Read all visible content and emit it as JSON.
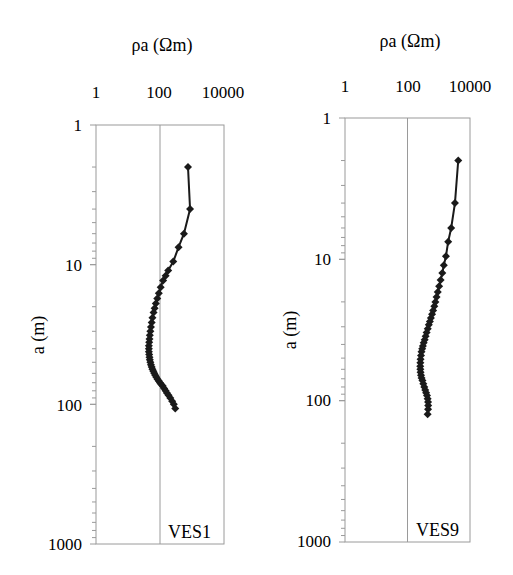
{
  "chart_data": [
    {
      "type": "scatter",
      "title": "",
      "xlabel": "ρa (Ωm)",
      "ylabel": "a (m)",
      "xscale": "log",
      "yscale": "log",
      "y_inverted": true,
      "x_axis_position": "top",
      "xlim": [
        1,
        10000
      ],
      "ylim": [
        1,
        1000
      ],
      "xticks": [
        "1",
        "100",
        "10000"
      ],
      "yticks": [
        "1",
        "10",
        "100",
        "1000"
      ],
      "grid": "vertical line at 100",
      "annotation": "VES1",
      "series": [
        {
          "name": "VES1",
          "marker": "diamond",
          "line": true,
          "x": [
            750,
            870,
            560,
            380,
            260,
            180,
            150,
            125,
            105,
            92,
            82,
            74,
            68,
            63,
            58,
            55,
            52,
            50,
            48,
            47,
            46,
            45,
            45,
            45,
            46,
            47,
            48,
            50,
            52,
            55,
            58,
            62,
            66,
            71,
            77,
            84,
            92,
            100,
            110,
            122,
            135,
            150,
            165,
            185,
            210,
            240,
            270,
            300
          ],
          "y": [
            2.0,
            4.0,
            6.0,
            7.5,
            9.5,
            11,
            12,
            13,
            14.5,
            16,
            17.5,
            19,
            20.5,
            22,
            24,
            26,
            28,
            30,
            32,
            34,
            36,
            38,
            40,
            42,
            44,
            46,
            48,
            50,
            52,
            54,
            56,
            58,
            60,
            62,
            64,
            66,
            68,
            70,
            72,
            74,
            77,
            80,
            83,
            86,
            90,
            95,
            100,
            107
          ]
        }
      ]
    },
    {
      "type": "scatter",
      "title": "",
      "xlabel": "ρa (Ωm)",
      "ylabel": "a (m)",
      "xscale": "log",
      "yscale": "log",
      "y_inverted": true,
      "x_axis_position": "top",
      "xlim": [
        1,
        10000
      ],
      "ylim": [
        1,
        1000
      ],
      "xticks": [
        "1",
        "100",
        "10000"
      ],
      "yticks": [
        "1",
        "10",
        "100",
        "1000"
      ],
      "grid": "vertical line at 100",
      "annotation": "VES9",
      "series": [
        {
          "name": "VES9",
          "marker": "diamond",
          "line": true,
          "x": [
            4200,
            3300,
            2500,
            2000,
            1700,
            1450,
            1300,
            1150,
            1030,
            930,
            850,
            780,
            720,
            660,
            610,
            560,
            520,
            480,
            445,
            410,
            380,
            355,
            330,
            310,
            295,
            280,
            270,
            262,
            258,
            256,
            258,
            262,
            270,
            282,
            300,
            320,
            345,
            370,
            395,
            420,
            440,
            455,
            460,
            455,
            440
          ],
          "y": [
            2.0,
            4.0,
            6.0,
            7.5,
            9.5,
            11,
            12.5,
            14,
            15.5,
            17,
            18.5,
            20,
            21.5,
            23,
            24.5,
            26,
            27.5,
            29,
            31,
            33,
            35,
            37,
            39,
            41,
            43,
            45,
            48,
            51,
            54,
            57,
            60,
            63,
            66,
            69,
            72,
            76,
            80,
            84,
            88,
            92,
            97,
            102,
            108,
            115,
            125
          ]
        }
      ]
    }
  ],
  "panels": [
    {
      "x_title": "ρa (Ωm)",
      "y_title": "a (m)",
      "x_ticks": [
        "1",
        "100",
        "10000"
      ],
      "y_ticks": [
        "1",
        "10",
        "100",
        "1000"
      ],
      "label": "VES1"
    },
    {
      "x_title": "ρa (Ωm)",
      "y_title": "a (m)",
      "x_ticks": [
        "1",
        "100",
        "10000"
      ],
      "y_ticks": [
        "1",
        "10",
        "100",
        "1000"
      ],
      "label": "VES9"
    }
  ],
  "colors": {
    "frame": "#9a9a9a",
    "series": "#1a1a1a",
    "text": "#222222"
  }
}
